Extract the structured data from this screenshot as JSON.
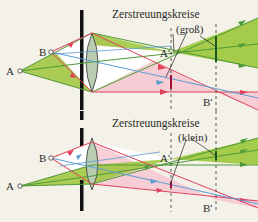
{
  "colors": {
    "background": "#f4f2e8",
    "green_fill": "#9cc63a",
    "green_ray": "#4e9a3a",
    "pink_fill": "#f7c9d3",
    "red_ray": "#e0405a",
    "blue_ray": "#5a9bd0",
    "lens_fill": "#b9cdb0",
    "aperture": "#111111",
    "dashed": "#333333"
  },
  "panels": [
    {
      "id": "top",
      "aperture_size": "large",
      "title": "Zerstreuungskreise",
      "subtitle": "(groß)",
      "labels": {
        "object_a": "A",
        "object_b": "B",
        "image_a": "A'",
        "image_b": "B'"
      }
    },
    {
      "id": "bottom",
      "aperture_size": "small",
      "title": "Zerstreuungskreise",
      "subtitle": "(klein)",
      "labels": {
        "object_a": "A",
        "object_b": "B",
        "image_a": "A'",
        "image_b": "B'"
      }
    }
  ]
}
